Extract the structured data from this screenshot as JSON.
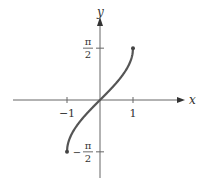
{
  "chart_data": {
    "type": "line",
    "title": "",
    "function": "y = arcsin(x)",
    "xlabel": "x",
    "ylabel": "y",
    "xlim": [
      -1.5,
      1.25
    ],
    "ylim": [
      -2.4,
      2.4
    ],
    "grid": false,
    "x_ticks": [
      {
        "value": -1,
        "label": "−1"
      },
      {
        "value": 1,
        "label": "1"
      }
    ],
    "y_ticks": [
      {
        "value": 1.5708,
        "num": "π",
        "den": "2",
        "sign": ""
      },
      {
        "value": -1.5708,
        "num": "π",
        "den": "2",
        "sign": "−"
      }
    ],
    "series": [
      {
        "name": "arcsin",
        "color": "#555555",
        "x": [
          -1,
          -0.9,
          -0.8,
          -0.7,
          -0.6,
          -0.5,
          -0.4,
          -0.3,
          -0.2,
          -0.1,
          0,
          0.1,
          0.2,
          0.3,
          0.4,
          0.5,
          0.6,
          0.7,
          0.8,
          0.9,
          1
        ],
        "y": [
          -1.5708,
          -1.1198,
          -0.9273,
          -0.7754,
          -0.6435,
          -0.5236,
          -0.4115,
          -0.3047,
          -0.2014,
          -0.1002,
          0,
          0.1002,
          0.2014,
          0.3047,
          0.4115,
          0.5236,
          0.6435,
          0.7754,
          0.9273,
          1.1198,
          1.5708
        ]
      }
    ],
    "endpoints": [
      {
        "x": -1,
        "y": -1.5708
      },
      {
        "x": 1,
        "y": 1.5708
      }
    ]
  }
}
